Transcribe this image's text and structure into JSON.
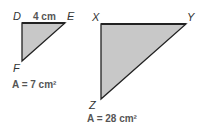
{
  "small_triangle": {
    "vertices": {
      "D": "D",
      "E": "E",
      "F": "F"
    },
    "side_label": "4 cm",
    "area_label": "A = 7 cm²"
  },
  "large_triangle": {
    "vertices": {
      "X": "X",
      "Y": "Y",
      "Z": "Z"
    },
    "area_label": "A = 28 cm²"
  },
  "colors": {
    "fill": "#c8c8c8",
    "stroke": "#222222"
  }
}
